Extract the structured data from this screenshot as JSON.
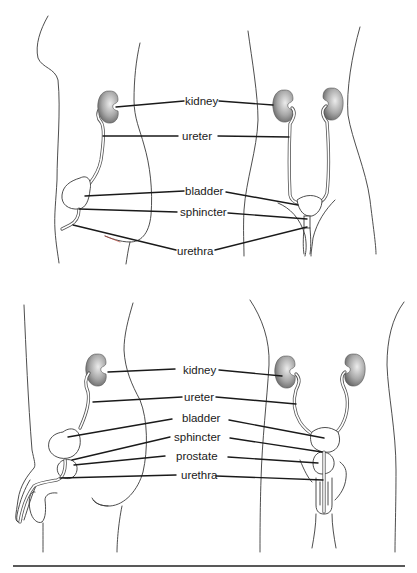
{
  "diagram": {
    "title": "",
    "panels": [
      {
        "name": "female-urinary-system",
        "labels": {
          "kidney": "kidney",
          "ureter": "ureter",
          "bladder": "bladder",
          "sphincter": "sphincter",
          "urethra": "urethra"
        },
        "views": [
          "side view",
          "front view"
        ]
      },
      {
        "name": "male-urinary-system",
        "labels": {
          "kidney": "kidney",
          "ureter": "ureter",
          "bladder": "bladder",
          "sphincter": "sphincter",
          "prostate": "prostate",
          "urethra": "urethra"
        },
        "views": [
          "side view",
          "front view"
        ]
      }
    ],
    "colors": {
      "line": "#1a1a1a",
      "outline": "#3a3a3a",
      "kidney_dark": "#6e6e6e",
      "kidney_light": "#e6e6e6",
      "background": "#ffffff"
    }
  }
}
